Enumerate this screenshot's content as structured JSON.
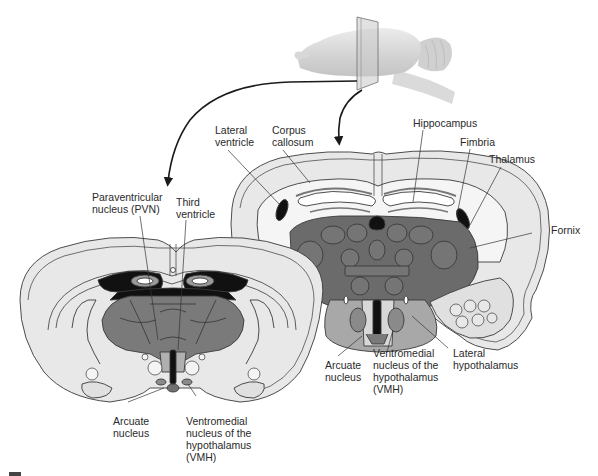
{
  "figure": {
    "colors": {
      "cortex": "#e8e8e8",
      "white_matter": "#f4f4f4",
      "thalamus_dark": "#6b6b6b",
      "hypothalamus_mid": "#a6a6a6",
      "nucleus": "#8a8a8a",
      "ventricle": "#000000",
      "outline": "#3a3a3a",
      "brain_3d": "#d9d9d9"
    }
  },
  "labels": {
    "right_section": {
      "lateral_ventricle": "Lateral\nventricle",
      "corpus_callosum": "Corpus\ncallosum",
      "hippocampus": "Hippocampus",
      "fimbria": "Fimbria",
      "thalamus": "Thalamus",
      "fornix": "Fornix",
      "arcuate_nucleus": "Arcuate\nnucleus",
      "vmh": "Ventromedial\nnucleus of the\nhypothalamus\n(VMH)",
      "lateral_hypothalamus": "Lateral\nhypothalamus"
    },
    "left_section": {
      "pvn": "Paraventricular\nnucleus (PVN)",
      "third_ventricle": "Third\nventricle",
      "arcuate_nucleus": "Arcuate\nnucleus",
      "vmh": "Ventromedial\nnucleus of the\nhypothalamus\n(VMH)"
    }
  }
}
